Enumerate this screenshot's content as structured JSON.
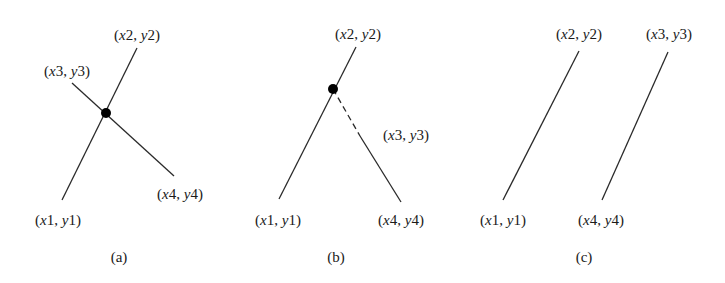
{
  "figure": {
    "panels": [
      {
        "id": "a",
        "caption": "(a)",
        "description": "Two segments intersecting at a point",
        "labels": {
          "p1": "(x1, y1)",
          "p2": "(x2, y2)",
          "p3": "(x3, y3)",
          "p4": "(x4, y4)"
        }
      },
      {
        "id": "b",
        "caption": "(b)",
        "description": "Segments meet at a point on extension (dashed)",
        "labels": {
          "p1": "(x1, y1)",
          "p2": "(x2, y2)",
          "p3": "(x3, y3)",
          "p4": "(x4, y4)"
        }
      },
      {
        "id": "c",
        "caption": "(c)",
        "description": "Parallel segments, no intersection",
        "labels": {
          "p1": "(x1, y1)",
          "p2": "(x2, y2)",
          "p3": "(x3, y3)",
          "p4": "(x4, y4)"
        }
      }
    ],
    "colors": {
      "line": "#2a2a2a",
      "dot": "#000000",
      "text": "#1a1a1a"
    }
  }
}
